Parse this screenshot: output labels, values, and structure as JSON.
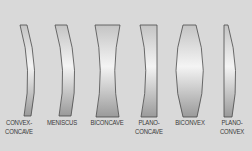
{
  "diagram": {
    "background": "#d9d9d9",
    "outline_color": "#4a4a4a",
    "lenses": [
      {
        "name": "convex-concave",
        "label_line1": "CONVEX-",
        "label_line2": "CONCAVE"
      },
      {
        "name": "meniscus",
        "label_line1": "MENISCUS",
        "label_line2": ""
      },
      {
        "name": "biconcave",
        "label_line1": "BICONCAVE",
        "label_line2": ""
      },
      {
        "name": "plano-concave",
        "label_line1": "PLANO-",
        "label_line2": "CONCAVE"
      },
      {
        "name": "biconvex",
        "label_line1": "BICONVEX",
        "label_line2": ""
      },
      {
        "name": "plano-convex",
        "label_line1": "PLANO-",
        "label_line2": "CONVEX"
      }
    ]
  }
}
